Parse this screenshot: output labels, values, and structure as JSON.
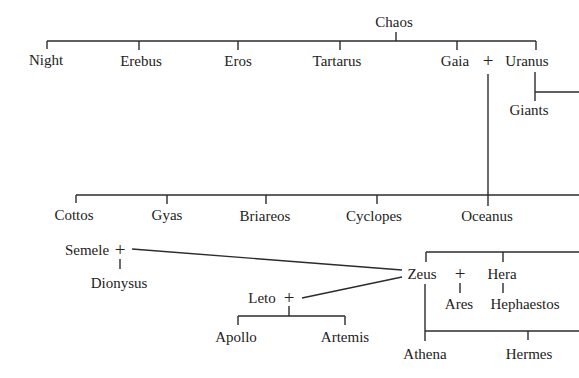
{
  "diagram": {
    "type": "family-tree",
    "colors": {
      "text": "#222222",
      "lines": "#2b2b2b",
      "background": "#ffffff"
    },
    "nodes": [
      {
        "id": "chaos",
        "label": "Chaos",
        "x": 394,
        "y": 22
      },
      {
        "id": "night",
        "label": "Night",
        "x": 46,
        "y": 60
      },
      {
        "id": "erebus",
        "label": "Erebus",
        "x": 141,
        "y": 61
      },
      {
        "id": "eros",
        "label": "Eros",
        "x": 238,
        "y": 61
      },
      {
        "id": "tartarus",
        "label": "Tartarus",
        "x": 337,
        "y": 61
      },
      {
        "id": "gaia",
        "label": "Gaia",
        "x": 455,
        "y": 61
      },
      {
        "id": "uranus",
        "label": "Uranus",
        "x": 527,
        "y": 61
      },
      {
        "id": "giants",
        "label": "Giants",
        "x": 529,
        "y": 110
      },
      {
        "id": "cottos",
        "label": "Cottos",
        "x": 74,
        "y": 215
      },
      {
        "id": "gyas",
        "label": "Gyas",
        "x": 167,
        "y": 215
      },
      {
        "id": "briareos",
        "label": "Briareos",
        "x": 265,
        "y": 216
      },
      {
        "id": "cyclopes",
        "label": "Cyclopes",
        "x": 374,
        "y": 216
      },
      {
        "id": "oceanus",
        "label": "Oceanus",
        "x": 487,
        "y": 216
      },
      {
        "id": "semele",
        "label": "Semele",
        "x": 87,
        "y": 250
      },
      {
        "id": "dionysus",
        "label": "Dionysus",
        "x": 119,
        "y": 283
      },
      {
        "id": "zeus",
        "label": "Zeus",
        "x": 422,
        "y": 274
      },
      {
        "id": "hera",
        "label": "Hera",
        "x": 502,
        "y": 274
      },
      {
        "id": "ares",
        "label": "Ares",
        "x": 459,
        "y": 304
      },
      {
        "id": "hephaestos",
        "label": "Hephaestos",
        "x": 525,
        "y": 304
      },
      {
        "id": "leto",
        "label": "Leto",
        "x": 262,
        "y": 298
      },
      {
        "id": "apollo",
        "label": "Apollo",
        "x": 236,
        "y": 337
      },
      {
        "id": "artemis",
        "label": "Artemis",
        "x": 345,
        "y": 337
      },
      {
        "id": "athena",
        "label": "Athena",
        "x": 425,
        "y": 354
      },
      {
        "id": "hermes",
        "label": "Hermes",
        "x": 529,
        "y": 354
      }
    ],
    "unions": [
      {
        "id": "gaia-uranus",
        "symbol": "+",
        "x": 488,
        "y": 60
      },
      {
        "id": "semele-zeus",
        "symbol": "+",
        "x": 120,
        "y": 249
      },
      {
        "id": "zeus-hera",
        "symbol": "+",
        "x": 460,
        "y": 273
      },
      {
        "id": "leto-zeus",
        "symbol": "+",
        "x": 289,
        "y": 297
      }
    ]
  }
}
